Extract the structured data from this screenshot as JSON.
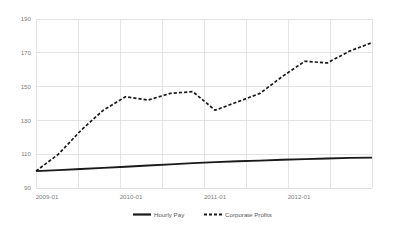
{
  "chart_data": {
    "type": "line",
    "title": "",
    "xlabel": "",
    "ylabel": "",
    "ylim": [
      90,
      190
    ],
    "yticks": [
      90,
      110,
      130,
      150,
      170,
      190
    ],
    "ytick_labels": [
      "90",
      "110",
      "130",
      "150",
      "170",
      "190"
    ],
    "grid": true,
    "legend_position": "bottom",
    "x": [
      "2009-01",
      "2009-04",
      "2009-07",
      "2009-10",
      "2010-01",
      "2010-04",
      "2010-07",
      "2010-10",
      "2011-01",
      "2011-04",
      "2011-07",
      "2011-10",
      "2012-01",
      "2012-04",
      "2012-07",
      "2012-10"
    ],
    "xtick_labels": [
      "2009-01",
      "2010-01",
      "2011-01",
      "2012-01"
    ],
    "xtick_positions": [
      "2009-01",
      "2010-01",
      "2011-01",
      "2012-01"
    ],
    "series": [
      {
        "name": "Hourly Pay",
        "style": "solid",
        "color": "#1a1a1a",
        "values": [
          100.0,
          100.6,
          101.2,
          101.9,
          102.6,
          103.3,
          104.0,
          104.7,
          105.3,
          105.8,
          106.2,
          106.7,
          107.1,
          107.5,
          107.8,
          108.0
        ]
      },
      {
        "name": "Corporate Profits",
        "style": "dashed",
        "color": "#1a1a1a",
        "values": [
          100.0,
          110.0,
          124.0,
          136.0,
          144.0,
          142.0,
          146.0,
          147.0,
          136.0,
          141.0,
          146.0,
          156.0,
          165.0,
          164.0,
          171.0,
          176.0
        ]
      }
    ],
    "annotations": []
  },
  "legend": {
    "items": [
      {
        "label": "Hourly Pay",
        "style": "solid"
      },
      {
        "label": "Corporate Profits",
        "style": "dashed"
      }
    ]
  }
}
